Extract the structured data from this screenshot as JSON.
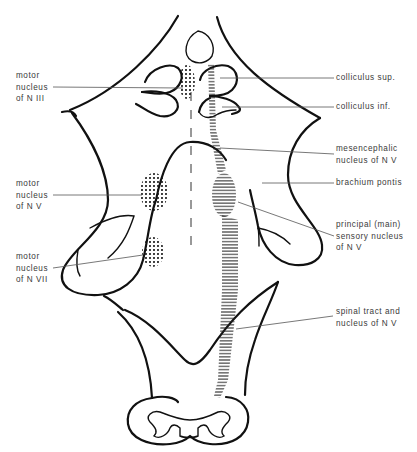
{
  "figure": {
    "colors": {
      "line": "#111111",
      "label_text": "#3a3a3a",
      "leader": "#555555",
      "background": "#ffffff"
    }
  },
  "labels_left": [
    {
      "id": "motor-nucleus-n-iii",
      "lines": [
        "motor",
        "nucleus",
        "of N III"
      ]
    },
    {
      "id": "motor-nucleus-n-v",
      "lines": [
        "motor",
        "nucleus",
        "of N V"
      ]
    },
    {
      "id": "motor-nucleus-n-vii",
      "lines": [
        "motor",
        "nucleus",
        "of N VII"
      ]
    }
  ],
  "labels_right": [
    {
      "id": "colliculus-sup",
      "lines": [
        "colliculus sup."
      ]
    },
    {
      "id": "colliculus-inf",
      "lines": [
        "colliculus inf."
      ]
    },
    {
      "id": "mesencephalic-nucleus-n-v",
      "lines": [
        "mesencephalic",
        "nucleus of N V"
      ]
    },
    {
      "id": "brachium-pontis",
      "lines": [
        "brachium pontis"
      ]
    },
    {
      "id": "principal-sensory-nucleus-n-v",
      "lines": [
        "principal (main)",
        "sensory nucleus",
        "of N V"
      ]
    },
    {
      "id": "spinal-tract-nucleus-n-v",
      "lines": [
        "spinal tract and",
        "nucleus of N V"
      ]
    }
  ]
}
